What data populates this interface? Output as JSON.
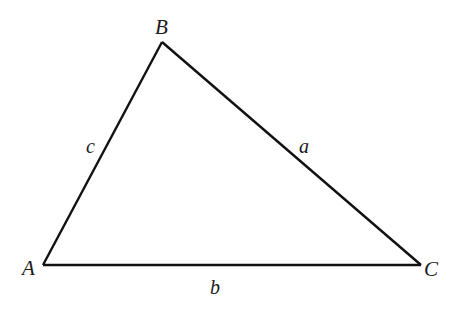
{
  "diagram": {
    "type": "triangle",
    "background": "#ffffff",
    "stroke_color": "#111111",
    "vertices": {
      "A": {
        "label": "A",
        "x": 43,
        "y": 265
      },
      "B": {
        "label": "B",
        "x": 162,
        "y": 42
      },
      "C": {
        "label": "C",
        "x": 421,
        "y": 265
      }
    },
    "sides": {
      "a": {
        "label": "a",
        "between": [
          "B",
          "C"
        ]
      },
      "b": {
        "label": "b",
        "between": [
          "A",
          "C"
        ]
      },
      "c": {
        "label": "c",
        "between": [
          "A",
          "B"
        ]
      }
    }
  }
}
